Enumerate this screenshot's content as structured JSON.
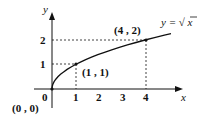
{
  "diagram": {
    "function_label": "y = √x",
    "function_label_prefix": "y =",
    "function_label_sqrt": "√",
    "function_label_arg": "x",
    "axis_labels": {
      "x": "x",
      "y": "y"
    },
    "x_ticks": [
      "1",
      "2",
      "3",
      "4"
    ],
    "y_ticks": [
      "1",
      "2"
    ],
    "origin_tick": "0",
    "points": [
      {
        "label": "(0 , 0)",
        "x": 0,
        "y": 0
      },
      {
        "label": "(1 , 1)",
        "x": 1,
        "y": 1
      },
      {
        "label": "(4 , 2)",
        "x": 4,
        "y": 2
      }
    ],
    "colors": {
      "ink": "#111111",
      "background": "#ffffff"
    }
  }
}
